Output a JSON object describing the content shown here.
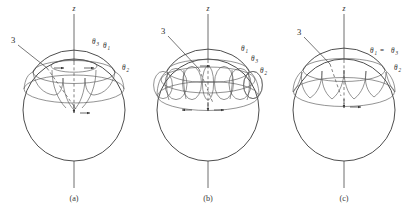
{
  "figure": {
    "background_color": "#ffffff",
    "line_color": "#4a4a4a",
    "text_color": "#2b2b2b",
    "axis_label": "z",
    "pointer_label": "3"
  },
  "panels": [
    {
      "id": "a",
      "caption": "(a)",
      "center_x": 74,
      "axis_label": "z",
      "pointer_label": "3",
      "theta_labels": [
        {
          "name": "theta-3",
          "symbol": "θ",
          "subscript": "3",
          "x": 92,
          "y": 44
        },
        {
          "name": "theta-1",
          "symbol": "θ",
          "subscript": "1",
          "x": 104,
          "y": 48
        },
        {
          "name": "theta-2",
          "symbol": "θ",
          "subscript": "2",
          "x": 122,
          "y": 70
        }
      ]
    },
    {
      "id": "b",
      "caption": "(b)",
      "center_x": 208,
      "axis_label": "z",
      "pointer_label": "3",
      "theta_labels": [
        {
          "name": "theta-1",
          "symbol": "θ",
          "subscript": "1",
          "x": 242,
          "y": 51
        },
        {
          "name": "theta-3",
          "symbol": "θ",
          "subscript": "3",
          "x": 252,
          "y": 61
        },
        {
          "name": "theta-2",
          "symbol": "θ",
          "subscript": "2",
          "x": 261,
          "y": 73
        }
      ]
    },
    {
      "id": "c",
      "caption": "(c)",
      "center_x": 344,
      "axis_label": "z",
      "pointer_label": "3",
      "theta_labels": [
        {
          "name": "theta-1",
          "symbol": "θ",
          "subscript": "1",
          "x": 371,
          "y": 52
        },
        {
          "name": "theta-3",
          "symbol": "θ",
          "subscript": "3",
          "x": 398,
          "y": 52
        },
        {
          "name": "theta-2",
          "symbol": "θ",
          "subscript": "2",
          "x": 395,
          "y": 70
        }
      ],
      "equality_sign": "="
    }
  ],
  "captions": {
    "a": "(a)",
    "b": "(b)",
    "c": "(c)"
  }
}
